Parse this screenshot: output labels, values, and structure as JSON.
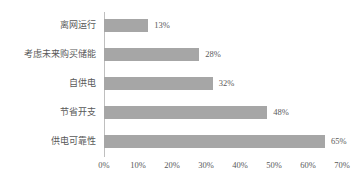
{
  "chart_data": {
    "type": "bar",
    "orientation": "horizontal",
    "title": "",
    "subtitle": "",
    "xlabel": "",
    "ylabel": "",
    "categories": [
      "离网运行",
      "考虑未来购买储能",
      "自供电",
      "节省开支",
      "供电可靠性"
    ],
    "values": [
      13,
      28,
      32,
      48,
      65
    ],
    "value_labels": [
      "13%",
      "28%",
      "32%",
      "48%",
      "65%"
    ],
    "xlim": [
      0,
      70
    ],
    "xticks": [
      0,
      10,
      20,
      30,
      40,
      50,
      60,
      70
    ],
    "xtick_labels": [
      "0%",
      "10%",
      "20%",
      "30%",
      "40%",
      "50%",
      "60%",
      "70%"
    ],
    "grid": false,
    "legend": false,
    "bar_color": "#a6a6a6",
    "axis_color": "#bfbfbf",
    "text_color": "#595959",
    "background": "#ffffff"
  }
}
